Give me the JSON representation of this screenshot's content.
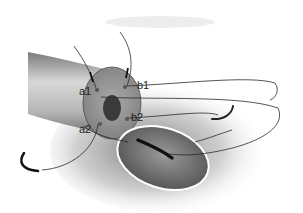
{
  "figure": {
    "type": "surgical-anastomosis-illustration",
    "labels": [
      {
        "id": "a1",
        "text": "a1",
        "x": 79,
        "y": 86
      },
      {
        "id": "b1",
        "text": "b1",
        "x": 137,
        "y": 80
      },
      {
        "id": "a2",
        "text": "a2",
        "x": 79,
        "y": 124
      },
      {
        "id": "b2",
        "text": "b2",
        "x": 131,
        "y": 112
      }
    ],
    "colors": {
      "tube": "#9a9a9a",
      "tube_dark": "#5a5a5a",
      "cut_face": "#8c8c8c",
      "lumen": "#3a3a3a",
      "suture": "#2a2a2a",
      "needle": "#111111",
      "opening": "#6e6e6e"
    }
  }
}
